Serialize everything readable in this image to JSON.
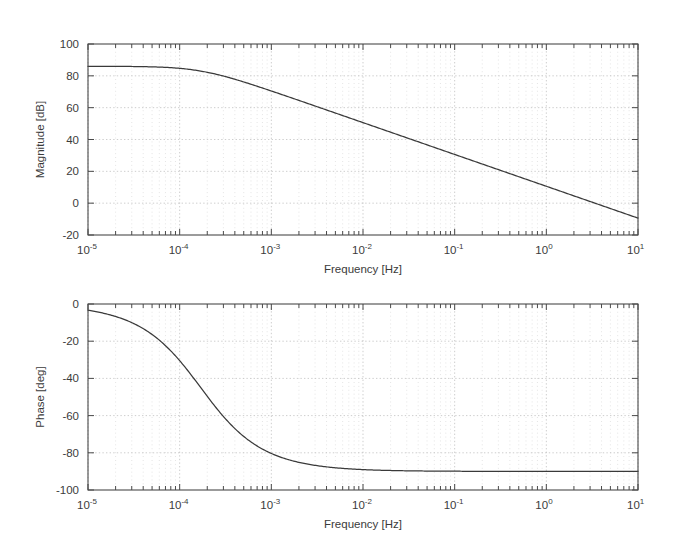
{
  "figure": {
    "kind": "bode-plot",
    "background_color": "#ffffff",
    "line_color": "#3a3a3a",
    "axis_color": "#4a4a4a",
    "grid_color": "#b9b9b9"
  },
  "chart_data": [
    {
      "type": "line",
      "id": "magnitude",
      "title": "",
      "xlabel": "Frequency [Hz]",
      "ylabel": "Magnitude [dB]",
      "xscale": "log",
      "yscale": "linear",
      "xlim": [
        1e-05,
        10
      ],
      "ylim": [
        -20,
        100
      ],
      "grid": true,
      "legend": null,
      "xticks": [
        1e-05,
        0.0001,
        0.001,
        0.01,
        0.1,
        1,
        10
      ],
      "xticklabels": [
        "10-5",
        "10-4",
        "10-3",
        "10-2",
        "10-1",
        "100",
        "101"
      ],
      "xtick_bases": [
        "10",
        "10",
        "10",
        "10",
        "10",
        "10",
        "10"
      ],
      "xtick_exponents": [
        "-5",
        "-4",
        "-3",
        "-2",
        "-1",
        "0",
        "1"
      ],
      "yticks": [
        -20,
        0,
        20,
        40,
        60,
        80,
        100
      ],
      "yticklabels": [
        "-20",
        "0",
        "20",
        "40",
        "60",
        "80",
        "100"
      ],
      "series": [
        {
          "name": "magnitude",
          "model": "first-order-lowpass",
          "dc_gain_db": 86,
          "corner_frequency_hz": 0.00017,
          "rolloff_db_per_decade": -20,
          "x": [
            1e-05,
            2e-05,
            4e-05,
            6e-05,
            8e-05,
            0.0001,
            0.00014,
            0.00017,
            0.0002,
            0.0003,
            0.0005,
            0.0007,
            0.001,
            0.002,
            0.005,
            0.01,
            0.02,
            0.05,
            0.1,
            0.2,
            0.5,
            1.0,
            2.0,
            5.0,
            10.0
          ],
          "values": [
            86.0,
            86.0,
            85.9,
            85.8,
            85.6,
            85.4,
            84.6,
            83.9,
            83.2,
            80.8,
            76.6,
            73.6,
            70.5,
            64.6,
            57.0,
            51.1,
            45.1,
            37.2,
            31.2,
            25.2,
            17.3,
            11.3,
            5.3,
            -2.6,
            -8.6
          ]
        }
      ]
    },
    {
      "type": "line",
      "id": "phase",
      "title": "",
      "xlabel": "Frequency [Hz]",
      "ylabel": "Phase [deg]",
      "xscale": "log",
      "yscale": "linear",
      "xlim": [
        1e-05,
        10
      ],
      "ylim": [
        -100,
        0
      ],
      "grid": true,
      "legend": null,
      "xticks": [
        1e-05,
        0.0001,
        0.001,
        0.01,
        0.1,
        1,
        10
      ],
      "xticklabels": [
        "10-5",
        "10-4",
        "10-3",
        "10-2",
        "10-1",
        "100",
        "101"
      ],
      "xtick_bases": [
        "10",
        "10",
        "10",
        "10",
        "10",
        "10",
        "10"
      ],
      "xtick_exponents": [
        "-5",
        "-4",
        "-3",
        "-2",
        "-1",
        "0",
        "1"
      ],
      "yticks": [
        -100,
        -80,
        -60,
        -40,
        -20,
        0
      ],
      "yticklabels": [
        "-100",
        "-80",
        "-60",
        "-40",
        "-20",
        "0"
      ],
      "series": [
        {
          "name": "phase",
          "model": "first-order-lowpass",
          "corner_frequency_hz": 0.00017,
          "asymptote_deg": -90,
          "x": [
            1e-05,
            2e-05,
            4e-05,
            6e-05,
            8e-05,
            0.0001,
            0.00014,
            0.00017,
            0.0002,
            0.0003,
            0.0005,
            0.0007,
            0.001,
            0.002,
            0.005,
            0.01,
            0.02,
            0.05,
            0.1,
            1.0,
            10.0
          ],
          "values": [
            -3.4,
            -6.7,
            -13.2,
            -19.4,
            -25.2,
            -30.5,
            -39.5,
            -45.0,
            -49.6,
            -60.5,
            -71.2,
            -76.3,
            -80.4,
            -85.1,
            -88.1,
            -89.0,
            -89.5,
            -89.8,
            -89.9,
            -90.0,
            -90.0
          ]
        }
      ]
    }
  ],
  "panels": {
    "magnitude": {
      "ylabel": "Magnitude [dB]",
      "xlabel": "Frequency [Hz]"
    },
    "phase": {
      "ylabel": "Phase [deg]",
      "xlabel": "Frequency [Hz]"
    }
  }
}
